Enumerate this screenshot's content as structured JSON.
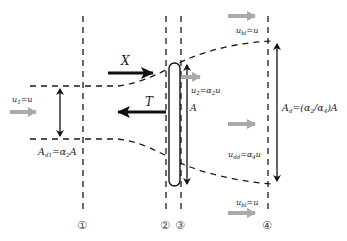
{
  "diagram": {
    "colors": {
      "line": "#1a1a1a",
      "flow_arrow": "#aaaaaa",
      "text": "#222222",
      "background": "#ffffff"
    },
    "stations": [
      {
        "id": "1",
        "label": "①"
      },
      {
        "id": "2",
        "label": "②"
      },
      {
        "id": "3",
        "label": "③"
      },
      {
        "id": "4",
        "label": "④"
      }
    ],
    "forces": {
      "x_label": "X",
      "t_label": "T"
    },
    "areas": {
      "a1_label": "A",
      "a1_sub": "d1",
      "a1_rhs": "=α",
      "a1_rhs_sub": "2",
      "a1_rhs_end": "A",
      "disc_label": "A",
      "a4_label": "A",
      "a4_sub": "d",
      "a4_rhs": "=(α",
      "a4_rhs_sub1": "2",
      "a4_rhs_mid": "/α",
      "a4_rhs_sub2": "4",
      "a4_rhs_end": ")A"
    },
    "velocities": {
      "u1": {
        "sym": "u",
        "sub": "1",
        "rhs": "=u"
      },
      "u2": {
        "sym": "u",
        "sub": "2",
        "rhs": "=α",
        "rhs_sub": "2",
        "rhs_end": "u"
      },
      "u4_top": {
        "sym": "u",
        "sub": "bl",
        "rhs": "=u"
      },
      "u4_mid": {
        "sym": "u",
        "sub": "dd",
        "rhs": "=α",
        "rhs_sub": "4",
        "rhs_end": "u"
      },
      "u4_bottom": {
        "sym": "u",
        "sub": "bl",
        "rhs": "=u"
      }
    }
  }
}
